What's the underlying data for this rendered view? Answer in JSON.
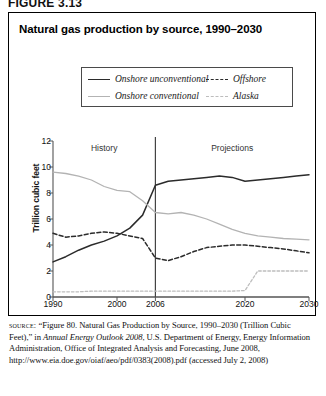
{
  "figure": {
    "label": "FIGURE 3.13",
    "title": "Natural gas production by source, 1990–2030"
  },
  "legend": {
    "items": [
      {
        "label": "Onshore unconventional",
        "style": "solid-dark",
        "color": "#2b2b2b"
      },
      {
        "label": "Offshore",
        "style": "dash-dark",
        "color": "#2b2b2b"
      },
      {
        "label": "Onshore conventional",
        "style": "solid-light",
        "color": "#b3b3b3"
      },
      {
        "label": "Alaska",
        "style": "dash-light",
        "color": "#bdbdbd"
      }
    ]
  },
  "annotations": {
    "history": "History",
    "projections": "Projections",
    "divider_year": 2006
  },
  "source": {
    "prefix": "source:",
    "text_1": "“Figure 80. Natural Gas Production by Source, 1990–2030 (Trillion Cubic Feet),” in ",
    "italic_1": "Annual Energy Outlook 2008",
    "text_2": ", U.S. Department of Energy, Energy Information Administration, Office of Integrated Analysis and Forecasting, June 2008, http://www.eia.doe.gov/oiaf/aeo/pdf/0383(2008).pdf (accessed July 2, 2008)"
  },
  "chart_data": {
    "type": "line",
    "title": "Natural gas production by source, 1990–2030",
    "xlabel": "",
    "ylabel": "Trillion cubic feet",
    "xlim": [
      1990,
      2030
    ],
    "ylim": [
      0,
      12
    ],
    "yticks": [
      0,
      2,
      4,
      6,
      8,
      10,
      12
    ],
    "xticks": [
      1990,
      2000,
      2006,
      2020,
      2030
    ],
    "grid": false,
    "legend_position": "top",
    "x": [
      1990,
      1992,
      1994,
      1996,
      1998,
      2000,
      2002,
      2004,
      2006,
      2008,
      2010,
      2012,
      2014,
      2016,
      2018,
      2020,
      2022,
      2024,
      2026,
      2028,
      2030
    ],
    "series": [
      {
        "name": "Onshore unconventional",
        "style": "solid",
        "color": "#2b2b2b",
        "values": [
          2.7,
          3.1,
          3.6,
          4.0,
          4.3,
          4.7,
          5.3,
          6.3,
          8.6,
          8.9,
          9.0,
          9.1,
          9.2,
          9.3,
          9.2,
          8.9,
          9.0,
          9.1,
          9.2,
          9.3,
          9.4
        ]
      },
      {
        "name": "Onshore conventional",
        "style": "solid",
        "color": "#b3b3b3",
        "values": [
          9.6,
          9.5,
          9.3,
          9.0,
          8.5,
          8.2,
          8.1,
          7.4,
          6.5,
          6.4,
          6.5,
          6.3,
          6.0,
          5.6,
          5.2,
          4.9,
          4.7,
          4.6,
          4.5,
          4.45,
          4.4
        ]
      },
      {
        "name": "Offshore",
        "style": "dashed",
        "color": "#2b2b2b",
        "values": [
          4.9,
          4.6,
          4.7,
          4.9,
          5.0,
          4.9,
          4.7,
          4.5,
          3.0,
          2.8,
          3.1,
          3.5,
          3.8,
          3.9,
          4.0,
          4.0,
          3.9,
          3.8,
          3.7,
          3.55,
          3.4
        ]
      },
      {
        "name": "Alaska",
        "style": "dotted",
        "color": "#bdbdbd",
        "values": [
          0.4,
          0.4,
          0.4,
          0.45,
          0.45,
          0.45,
          0.45,
          0.45,
          0.45,
          0.45,
          0.45,
          0.45,
          0.45,
          0.45,
          0.45,
          0.5,
          2.0,
          2.0,
          2.0,
          2.0,
          2.0
        ]
      }
    ]
  }
}
